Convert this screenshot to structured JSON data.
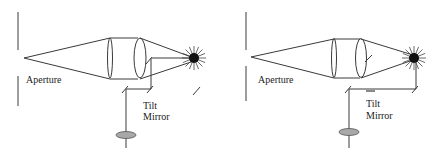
{
  "panels": [
    {
      "id": "left",
      "labels": {
        "aperture": "Aperture",
        "mirror_line1": "Tilt",
        "mirror_line2": "Mirror"
      },
      "state": "mirror deflects light away from detector"
    },
    {
      "id": "right",
      "labels": {
        "aperture": "Aperture",
        "mirror_line1": "Tilt",
        "mirror_line2": "Mirror"
      },
      "state": "mirror redirects star light to detector"
    }
  ],
  "colors": {
    "line": "#3a3a3a",
    "star": "#111111",
    "detector": "#a8a8a8"
  }
}
